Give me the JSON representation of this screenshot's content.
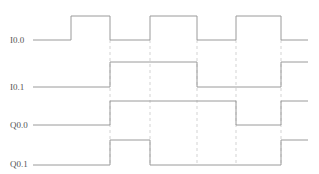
{
  "diagram": {
    "type": "timing-diagram",
    "x_start": 33,
    "x_end": 308,
    "transitions_x": [
      71,
      110,
      150,
      197,
      236,
      281
    ],
    "grid_lines_x": [
      110,
      150,
      197,
      236,
      281
    ],
    "signals": [
      {
        "name": "I0.0",
        "label_y": 43,
        "high_y": 16,
        "low_y": 40,
        "levels": [
          0,
          1,
          0,
          1,
          0,
          1,
          0
        ]
      },
      {
        "name": "I0.1",
        "label_y": 90,
        "high_y": 62,
        "low_y": 87,
        "levels": [
          0,
          0,
          1,
          1,
          0,
          0,
          1
        ]
      },
      {
        "name": "Q0.0",
        "label_y": 128,
        "high_y": 101,
        "low_y": 125,
        "levels": [
          0,
          0,
          1,
          1,
          1,
          0,
          1
        ]
      },
      {
        "name": "Q0.1",
        "label_y": 167,
        "high_y": 140,
        "low_y": 165,
        "levels": [
          0,
          0,
          1,
          0,
          0,
          0,
          1
        ]
      }
    ]
  }
}
